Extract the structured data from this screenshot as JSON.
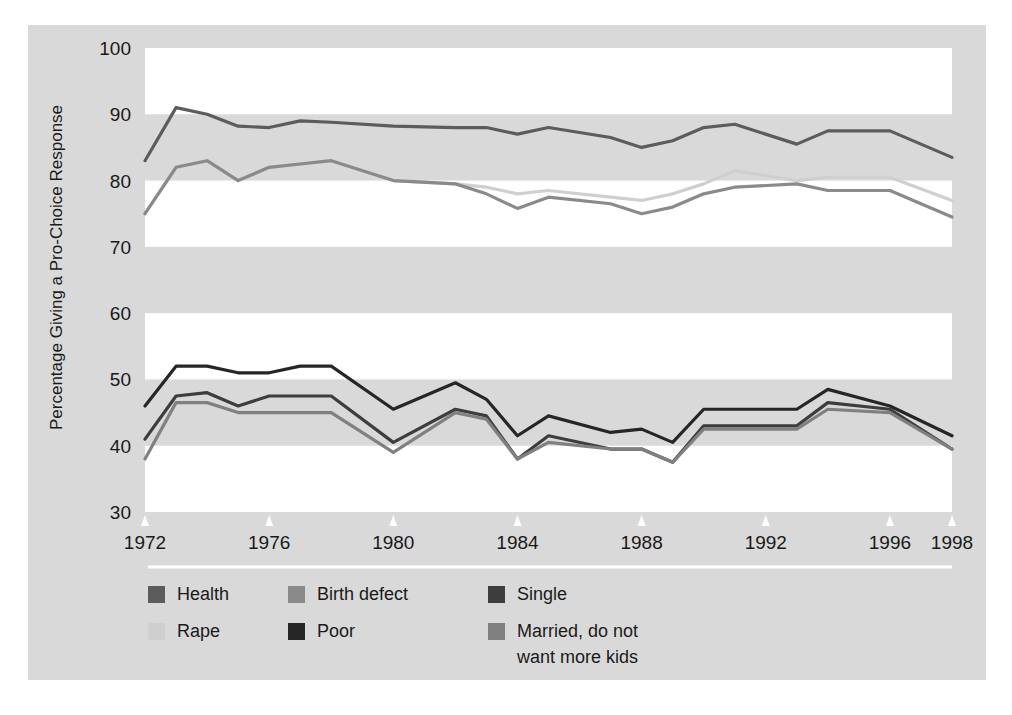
{
  "figure": {
    "background_color": "#ffffff",
    "panel_color": "#d9d9d9",
    "band_white": "#ffffff",
    "band_gray": "#d9d9d9",
    "separator_color": "#ffffff"
  },
  "chart_data": {
    "type": "line",
    "title": "",
    "subtitle": "",
    "xlabel": "",
    "ylabel": "Percentage  Giving a Pro-Choice Response",
    "xlim": [
      1972,
      1998
    ],
    "ylim": [
      30,
      100
    ],
    "ytick_values": [
      30,
      40,
      50,
      60,
      70,
      80,
      90,
      100
    ],
    "ytick_labels": [
      "30",
      "40",
      "50",
      "60",
      "70",
      "80",
      "90",
      "100"
    ],
    "xtick_values": [
      1972,
      1976,
      1980,
      1984,
      1988,
      1992,
      1996,
      1998
    ],
    "xtick_labels": [
      "1972",
      "1976",
      "1980",
      "1984",
      "1988",
      "1992",
      "1996",
      "1998"
    ],
    "grid": "banded-horizontal",
    "legend_position": "below-plot",
    "x": [
      1972,
      1973,
      1974,
      1975,
      1976,
      1977,
      1978,
      1980,
      1982,
      1983,
      1984,
      1985,
      1987,
      1988,
      1989,
      1990,
      1991,
      1993,
      1994,
      1996,
      1998
    ],
    "series": [
      {
        "name": "Health",
        "color": "#5c5c5c",
        "values": [
          83.0,
          91.0,
          90.0,
          88.2,
          88.0,
          89.0,
          88.8,
          88.2,
          88.0,
          88.0,
          87.0,
          88.0,
          86.5,
          85.0,
          86.0,
          88.0,
          88.5,
          85.5,
          87.5,
          87.5,
          83.5
        ]
      },
      {
        "name": "Rape",
        "color": "#cfcfcf",
        "values": [
          75.0,
          82.0,
          83.0,
          80.0,
          82.0,
          82.5,
          83.0,
          80.0,
          79.5,
          79.0,
          78.0,
          78.5,
          77.5,
          77.0,
          78.0,
          79.5,
          81.5,
          80.0,
          80.5,
          80.5,
          77.0
        ]
      },
      {
        "name": "Birth defect",
        "color": "#8a8a8a",
        "values": [
          75.0,
          82.0,
          83.0,
          80.0,
          82.0,
          82.5,
          83.0,
          80.0,
          79.5,
          78.0,
          75.8,
          77.5,
          76.5,
          75.0,
          76.0,
          78.0,
          79.0,
          79.5,
          78.5,
          78.5,
          74.5
        ]
      },
      {
        "name": "Poor",
        "color": "#262626",
        "values": [
          46.0,
          52.0,
          52.0,
          51.0,
          51.0,
          52.0,
          52.0,
          45.5,
          49.5,
          47.0,
          41.5,
          44.5,
          42.0,
          42.5,
          40.5,
          45.5,
          45.5,
          45.5,
          48.5,
          46.0,
          41.5
        ]
      },
      {
        "name": "Single",
        "color": "#3d3d3d",
        "values": [
          41.0,
          47.5,
          48.0,
          46.0,
          47.5,
          47.5,
          47.5,
          40.5,
          45.5,
          44.5,
          38.0,
          41.5,
          39.5,
          39.5,
          37.5,
          43.0,
          43.0,
          43.0,
          46.5,
          45.5,
          39.5
        ]
      },
      {
        "name": "Married, do not want more kids",
        "color": "#808080",
        "values": [
          38.0,
          46.5,
          46.5,
          45.0,
          45.0,
          45.0,
          45.0,
          39.0,
          45.0,
          44.0,
          38.0,
          40.5,
          39.5,
          39.5,
          37.5,
          42.5,
          42.5,
          42.5,
          45.5,
          45.0,
          39.5
        ]
      }
    ]
  },
  "legend": {
    "columns": [
      [
        {
          "label": "Health",
          "color": "#5c5c5c"
        },
        {
          "label": "Rape",
          "color": "#cfcfcf"
        }
      ],
      [
        {
          "label": "Birth defect",
          "color": "#8a8a8a"
        },
        {
          "label": "Poor",
          "color": "#262626"
        }
      ],
      [
        {
          "label": "Single",
          "color": "#3d3d3d"
        },
        {
          "label": "Married, do not",
          "label2": "want more kids",
          "color": "#808080"
        }
      ]
    ]
  }
}
